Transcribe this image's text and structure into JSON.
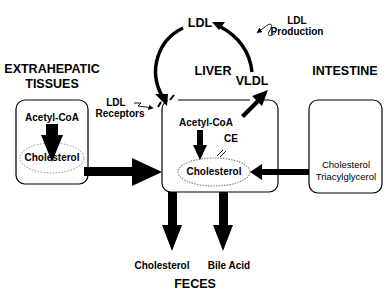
{
  "regions": {
    "extrahepatic": {
      "title_line1": "EXTRAHEPATIC",
      "title_line2": "TISSUES",
      "top": "Acetyl-CoA",
      "pool": "Cholesterol"
    },
    "liver": {
      "title": "LIVER",
      "top": "Acetyl-CoA",
      "pool": "Cholesterol",
      "ce": "CE"
    },
    "intestine": {
      "title": "INTESTINE",
      "line1": "Cholesterol",
      "line2": "Triacylglycerol"
    },
    "feces": {
      "title": "FECES",
      "out1": "Cholesterol",
      "out2": "Bile Acid"
    }
  },
  "lipoproteins": {
    "ldl": "LDL",
    "vldl": "VLDL"
  },
  "annotations": {
    "ldl_production_line1": "LDL",
    "ldl_production_line2": "Production",
    "ldl_receptors_line1": "LDL",
    "ldl_receptors_line2": "Receptors"
  }
}
